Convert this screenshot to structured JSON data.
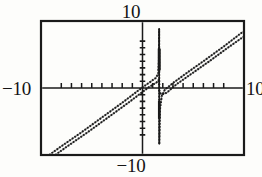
{
  "figure": {
    "background_color": "#fdfdfb",
    "ink_color": "#1a1a1a",
    "frame": {
      "x0": 41,
      "y0": 21,
      "x1": 244,
      "y1": 155,
      "stroke_width": 2.2
    }
  },
  "labels": {
    "top": "10",
    "bottom": "−10",
    "left": "−10",
    "right": "10"
  },
  "chart_data": {
    "type": "line",
    "title": "",
    "subtitle": "",
    "xlabel": "",
    "ylabel": "",
    "xlim": [
      -10,
      10
    ],
    "ylim": [
      -10,
      10
    ],
    "grid": false,
    "legend": null,
    "axis_style": "centered-crosshair-with-ticks",
    "x_axis": {
      "position_y_value": 0,
      "tick_spacing": 1,
      "tick_count": 17,
      "tick_length_px": 5,
      "tick_values": [
        -8,
        -7,
        -6,
        -5,
        -4,
        -3,
        -2,
        -1,
        1,
        2,
        3,
        4,
        5,
        6,
        7,
        8
      ],
      "tick_labels_shown": false,
      "end_labels": [
        "−10",
        "10"
      ]
    },
    "y_axis": {
      "position_x_value": 0,
      "tick_spacing": 1,
      "tick_count": 15,
      "tick_length_px": 5,
      "tick_values": [
        -7,
        -6,
        -5,
        -4,
        -3,
        -2,
        -1,
        1,
        2,
        3,
        4,
        5,
        6,
        7
      ],
      "tick_labels_shown": false,
      "end_labels": [
        "−10",
        "10"
      ]
    },
    "asymptote": {
      "kind": "vertical",
      "x": 1.65,
      "y_from": -8.4,
      "y_to": 8.8,
      "note": "near-vertical drawn segment at the singularity"
    },
    "series": [
      {
        "name": "curve-upper",
        "style": "dotted-thin",
        "comment": "slope ~1 line branch, passes slightly above the companion line",
        "points": [
          [
            -9.2,
            -10.0
          ],
          [
            -8.0,
            -8.7
          ],
          [
            -6.0,
            -6.6
          ],
          [
            -4.0,
            -4.4
          ],
          [
            -2.0,
            -2.2
          ],
          [
            -1.0,
            -1.05
          ],
          [
            0.0,
            0.1
          ],
          [
            0.8,
            0.95
          ],
          [
            1.3,
            1.5
          ],
          [
            1.55,
            2.1
          ],
          [
            1.62,
            4.2
          ],
          [
            1.64,
            8.8
          ],
          [
            1.66,
            -8.4
          ],
          [
            1.72,
            -3.2
          ],
          [
            1.9,
            -1.2
          ],
          [
            2.2,
            -0.25
          ],
          [
            3.0,
            0.75
          ],
          [
            4.5,
            2.4
          ],
          [
            6.0,
            4.0
          ],
          [
            8.0,
            6.2
          ],
          [
            9.9,
            8.4
          ]
        ]
      },
      {
        "name": "curve-lower",
        "style": "dotted-thin",
        "comment": "second near-parallel branch offset slightly below-right",
        "points": [
          [
            -8.6,
            -10.0
          ],
          [
            -7.4,
            -8.7
          ],
          [
            -5.4,
            -6.6
          ],
          [
            -3.4,
            -4.4
          ],
          [
            -1.4,
            -2.2
          ],
          [
            -0.4,
            -1.05
          ],
          [
            0.6,
            0.1
          ],
          [
            1.35,
            0.8
          ],
          [
            1.55,
            1.0
          ],
          [
            1.62,
            1.3
          ],
          [
            1.66,
            -0.6
          ],
          [
            1.9,
            -1.0
          ],
          [
            2.4,
            -0.7
          ],
          [
            3.3,
            0.5
          ],
          [
            4.9,
            2.2
          ],
          [
            6.5,
            3.9
          ],
          [
            8.4,
            6.0
          ],
          [
            10.0,
            7.7
          ]
        ]
      }
    ],
    "annotations": [
      {
        "text": "10",
        "position": "top-center"
      },
      {
        "text": "−10",
        "position": "bottom-center"
      },
      {
        "text": "−10",
        "position": "left-middle"
      },
      {
        "text": "10",
        "position": "right-middle"
      }
    ]
  }
}
